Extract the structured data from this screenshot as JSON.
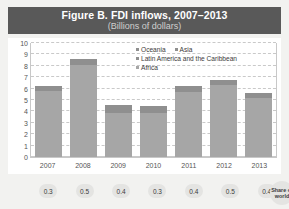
{
  "figure": {
    "title": "Figure B. FDI inflows, 2007–2013",
    "subtitle": "(Billions of dollars)"
  },
  "share_strip": {
    "values": [
      "0.3",
      "0.5",
      "0.4",
      "0.3",
      "0.4",
      "0.5",
      "0.4"
    ],
    "badge_line1": "Share of",
    "badge_line2": "world"
  },
  "colors": {
    "title_band": "#595959",
    "bar_light": "#a6a6a6",
    "bar_dark": "#8f8f8f",
    "gridline": "#c9c9c9",
    "page_background": "#f2f2f0"
  },
  "chart_data": {
    "type": "bar",
    "title": "Figure B. FDI inflows, 2007–2013",
    "subtitle": "(Billions of dollars)",
    "xlabel": "",
    "ylabel": "Billions of dollars",
    "ylim": [
      0,
      10
    ],
    "yticks": [
      0,
      1,
      2,
      3,
      4,
      5,
      6,
      7,
      8,
      9,
      10
    ],
    "grid": true,
    "stacked": true,
    "legend_position": "inside-top-right",
    "categories": [
      "2007",
      "2008",
      "2009",
      "2010",
      "2011",
      "2012",
      "2013"
    ],
    "series": [
      {
        "name": "Africa",
        "color": "#a6a6a6",
        "values": [
          5.8,
          8.1,
          3.9,
          3.9,
          5.7,
          6.3,
          5.2
        ]
      },
      {
        "name": "Latin America and the Caribbean",
        "color": "#8f8f8f",
        "values": [
          0.4,
          0.5,
          0.7,
          0.6,
          0.5,
          0.5,
          0.4
        ]
      },
      {
        "name": "Asia",
        "color": "#8f8f8f",
        "values": [
          0,
          0,
          0,
          0,
          0,
          0,
          0
        ]
      },
      {
        "name": "Oceania",
        "color": "#8f8f8f",
        "values": [
          0,
          0,
          0,
          0,
          0,
          0,
          0
        ]
      }
    ],
    "totals": [
      6.2,
      8.6,
      4.6,
      4.5,
      6.2,
      6.8,
      5.6
    ],
    "annotations": {
      "share_of_world": [
        "0.3",
        "0.5",
        "0.4",
        "0.3",
        "0.4",
        "0.5",
        "0.4"
      ]
    }
  }
}
